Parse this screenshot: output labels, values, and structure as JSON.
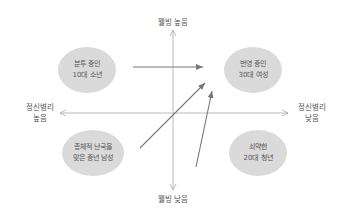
{
  "diagram": {
    "type": "quadrant",
    "axes": {
      "vertical": {
        "top_label": "웰빙 높음",
        "bottom_label": "웰빙 낮음"
      },
      "horizontal": {
        "left_label_line1": "정신병리",
        "left_label_line2": "높음",
        "right_label_line1": "정신병리",
        "right_label_line2": "낮음"
      }
    },
    "quadrants": [
      {
        "position": "top-left",
        "line1": "분투 중인",
        "line2": "10대 소년"
      },
      {
        "position": "top-right",
        "line1": "번영 중인",
        "line2": "30대 여성"
      },
      {
        "position": "bottom-left",
        "line1": "총체적 난국을",
        "line2": "맞은 중년 남성"
      },
      {
        "position": "bottom-right",
        "line1": "쇠약한",
        "line2": "20대 청년"
      }
    ],
    "arrows": [
      {
        "from": "top-left",
        "to": "top-right"
      },
      {
        "from": "bottom-left",
        "to": "top-right"
      },
      {
        "from": "bottom-right",
        "to": "top-right"
      }
    ],
    "colors": {
      "axis": "#a8a8a8",
      "arrow": "#777777",
      "bubble": "#dadada",
      "text": "#555555"
    }
  }
}
